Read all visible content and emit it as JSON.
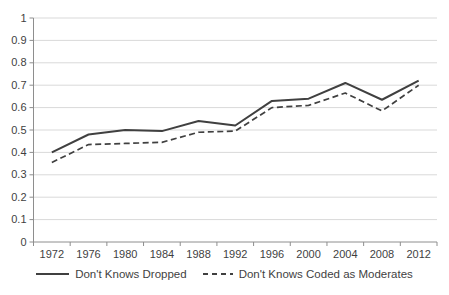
{
  "chart_data": {
    "type": "line",
    "title": "",
    "xlabel": "",
    "ylabel": "",
    "x_labels": [
      "1972",
      "1976",
      "1980",
      "1984",
      "1988",
      "1992",
      "1996",
      "2000",
      "2004",
      "2008",
      "2012"
    ],
    "series": [
      {
        "name": "Don't Knows Dropped",
        "style": "solid",
        "values": [
          0.4,
          0.48,
          0.5,
          0.495,
          0.54,
          0.52,
          0.63,
          0.64,
          0.71,
          0.635,
          0.72
        ]
      },
      {
        "name": "Don't Knows Coded as Moderates",
        "style": "dashed",
        "values": [
          0.355,
          0.435,
          0.44,
          0.445,
          0.49,
          0.495,
          0.6,
          0.61,
          0.665,
          0.585,
          0.7
        ]
      }
    ],
    "y_ticks": [
      "0",
      "0.1",
      "0.2",
      "0.3",
      "0.4",
      "0.5",
      "0.6",
      "0.7",
      "0.8",
      "0.9",
      "1"
    ],
    "y_tick_values": [
      0,
      0.1,
      0.2,
      0.3,
      0.4,
      0.5,
      0.6,
      0.7,
      0.8,
      0.9,
      1
    ],
    "ylim": [
      0,
      1
    ],
    "grid": "horizontal",
    "legend_position": "bottom",
    "colors": {
      "line": "#404040",
      "grid": "#d9d9d9",
      "axis": "#8e8e8e",
      "text": "#3f3f3f"
    }
  }
}
